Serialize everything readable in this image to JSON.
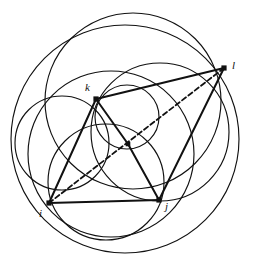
{
  "figure": {
    "name": "circle-packing-geometry-diagram",
    "canvas": {
      "width": 256,
      "height": 275
    },
    "colors": {
      "background": "#ffffff",
      "stroke": "#111111",
      "vertex_fill": "#111111"
    },
    "stroke_widths": {
      "circle": 1.15,
      "segment": 2.0,
      "dashed": 1.8
    },
    "dash_pattern": "5 3"
  },
  "vertices": [
    {
      "id": "i",
      "label": "i",
      "x": 49,
      "y": 203,
      "label_x": 39,
      "label_y": 208,
      "marker_size": 5.2
    },
    {
      "id": "j",
      "label": "j",
      "x": 159,
      "y": 200,
      "label_x": 165,
      "label_y": 201,
      "marker_size": 5.2
    },
    {
      "id": "k",
      "label": "k",
      "x": 96,
      "y": 99,
      "label_x": 85,
      "label_y": 82,
      "marker_size": 5.2
    },
    {
      "id": "l",
      "label": "l",
      "x": 224,
      "y": 68,
      "label_x": 232,
      "label_y": 60,
      "marker_size": 5.2
    },
    {
      "id": "center",
      "label": "",
      "x": 128,
      "y": 144,
      "label_x": 0,
      "label_y": 0,
      "marker_size": 4.6
    }
  ],
  "circles": [
    {
      "name": "outer-circumscribing-circle",
      "cx": 125,
      "cy": 139,
      "r": 114
    },
    {
      "name": "large-upper-circle",
      "cx": 133,
      "cy": 101,
      "r": 88
    },
    {
      "name": "left-circle-through-i-k",
      "cx": 62,
      "cy": 143,
      "r": 47
    },
    {
      "name": "lower-circle-through-i-j",
      "cx": 106,
      "cy": 182,
      "r": 58
    },
    {
      "name": "small-circle-through-k-center",
      "cx": 127,
      "cy": 117,
      "r": 32
    },
    {
      "name": "right-lens-circle-through-center-l",
      "cx": 160,
      "cy": 132,
      "r": 69
    },
    {
      "name": "bottom-circle-through-i-j",
      "cx": 111,
      "cy": 154,
      "r": 83
    }
  ],
  "segments": [
    {
      "name": "segment-i-j",
      "x1": 49,
      "y1": 203,
      "x2": 159,
      "y2": 200,
      "style": "solid"
    },
    {
      "name": "segment-i-k",
      "x1": 49,
      "y1": 203,
      "x2": 96,
      "y2": 99,
      "style": "solid"
    },
    {
      "name": "segment-k-l",
      "x1": 96,
      "y1": 99,
      "x2": 224,
      "y2": 68,
      "style": "solid"
    },
    {
      "name": "segment-j-l",
      "x1": 159,
      "y1": 200,
      "x2": 224,
      "y2": 68,
      "style": "solid"
    },
    {
      "name": "segment-k-center",
      "x1": 96,
      "y1": 99,
      "x2": 128,
      "y2": 144,
      "style": "solid"
    },
    {
      "name": "segment-center-j",
      "x1": 128,
      "y1": 144,
      "x2": 159,
      "y2": 200,
      "style": "solid"
    },
    {
      "name": "segment-i-l-dashed",
      "x1": 49,
      "y1": 203,
      "x2": 224,
      "y2": 68,
      "style": "dashed"
    }
  ]
}
